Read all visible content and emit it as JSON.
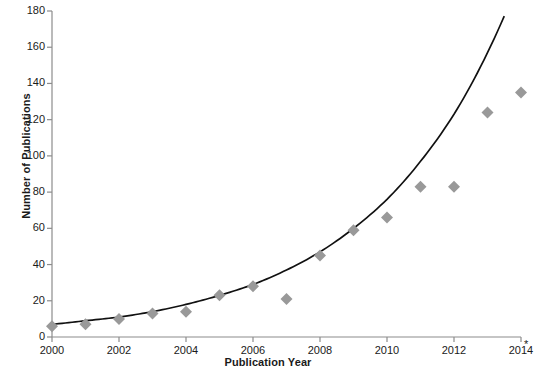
{
  "chart_data": {
    "type": "scatter",
    "title": "",
    "xlabel": "Publication Year",
    "ylabel": "Number of Publications",
    "xlim": [
      2000,
      2014
    ],
    "ylim": [
      0,
      180
    ],
    "grid": false,
    "legend": null,
    "x_tick_labels": [
      "2000",
      "2002",
      "2004",
      "2006",
      "2008",
      "2010",
      "2012",
      "2014"
    ],
    "x_tick_values": [
      2000,
      2002,
      2004,
      2006,
      2008,
      2010,
      2012,
      2014
    ],
    "y_tick_labels": [
      "0",
      "20",
      "40",
      "60",
      "80",
      "100",
      "120",
      "140",
      "160",
      "180"
    ],
    "y_tick_values": [
      0,
      20,
      40,
      60,
      80,
      100,
      120,
      140,
      160,
      180
    ],
    "annotations": [
      "*"
    ],
    "x": [
      2000,
      2001,
      2002,
      2003,
      2004,
      2005,
      2006,
      2007,
      2008,
      2009,
      2010,
      2011,
      2012,
      2013,
      2014
    ],
    "values": [
      6,
      7,
      10,
      13,
      14,
      23,
      28,
      21,
      45,
      59,
      66,
      83,
      83,
      124,
      135
    ],
    "series": [
      {
        "name": "Publications",
        "marker": "diamond",
        "marker_color": "#999999",
        "values": [
          6,
          7,
          10,
          13,
          14,
          23,
          28,
          21,
          45,
          59,
          66,
          83,
          83,
          124,
          135
        ]
      },
      {
        "name": "Exponential trendline",
        "marker": "none",
        "line_color": "#1a1a1a",
        "values": [
          7,
          9,
          11,
          14,
          18,
          23,
          29,
          37,
          47,
          60,
          76,
          97,
          123,
          157,
          200
        ]
      }
    ]
  },
  "axes": {
    "y_axis_title": "Number of Publications",
    "x_axis_title": "Publication Year",
    "footnote_marker": "*"
  }
}
